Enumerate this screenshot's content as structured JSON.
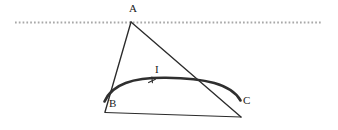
{
  "figure": {
    "title": "",
    "background_color": "#ffffff",
    "width": 338,
    "height": 130,
    "labels": {
      "apex": "A",
      "base_left": "B",
      "base_right": "C",
      "arc_current": "I"
    },
    "colors": {
      "line_stroke": "#2b2b2b",
      "arc_stroke": "#2f2f2f",
      "dotted_line": "#a8a8a8",
      "text": "#1a1a1a"
    },
    "geometry": {
      "dotted_line": {
        "x1": 15,
        "y1": 22,
        "x2": 322,
        "y2": 22
      },
      "vertex_a": {
        "x": 131,
        "y": 22
      },
      "vertex_b": {
        "x": 105,
        "y": 112
      },
      "vertex_c": {
        "x": 241,
        "y": 117
      },
      "arc_start": {
        "x": 104,
        "y": 101
      },
      "arc_end": {
        "x": 240,
        "y": 101
      },
      "arc_apex_y": 78,
      "tick_x": 152,
      "tick_y": 81
    },
    "elements": [
      "dotted-horizontal-line",
      "triangle-side-ab",
      "triangle-side-ac",
      "triangle-side-bc",
      "current-arc",
      "arc-direction-tick"
    ]
  }
}
